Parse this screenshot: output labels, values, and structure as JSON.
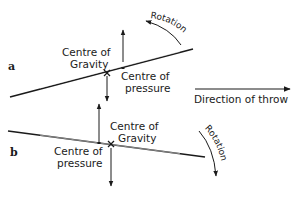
{
  "figure": {
    "panel_a": {
      "label": "a",
      "centre_of_gravity": [
        "Centre of",
        "Gravity"
      ],
      "centre_of_pressure": [
        "Centre of",
        "pressure"
      ],
      "rotation": "Rotation",
      "rotation_direction": "anticlockwise"
    },
    "panel_b": {
      "label": "b",
      "centre_of_gravity": [
        "Centre of",
        "Gravity"
      ],
      "centre_of_pressure": [
        "Centre of",
        "pressure"
      ],
      "rotation": "Rotation",
      "rotation_direction": "clockwise"
    },
    "direction_of_throw": "Direction of throw"
  },
  "colors": {
    "ink": "#1a1a1a",
    "background": "#ffffff"
  }
}
